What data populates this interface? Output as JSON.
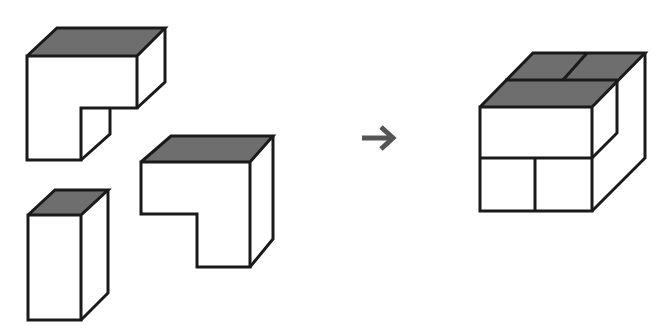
{
  "diagram": {
    "pieces": [
      {
        "id": "piece-1",
        "shape": "L-block",
        "top_color": "#6e6e6e"
      },
      {
        "id": "piece-2",
        "shape": "rectangular-prism",
        "top_color": "#6e6e6e"
      },
      {
        "id": "piece-3",
        "shape": "L-block",
        "top_color": "#6e6e6e"
      }
    ],
    "arrow": {
      "glyph": "right-arrow",
      "color": "#555555"
    },
    "result": {
      "id": "assembled-cube",
      "top_color": "#6e6e6e"
    },
    "colors": {
      "edge": "#1a1a1a",
      "top_face": "#6e6e6e",
      "face": "#ffffff",
      "background": "#ffffff"
    }
  }
}
